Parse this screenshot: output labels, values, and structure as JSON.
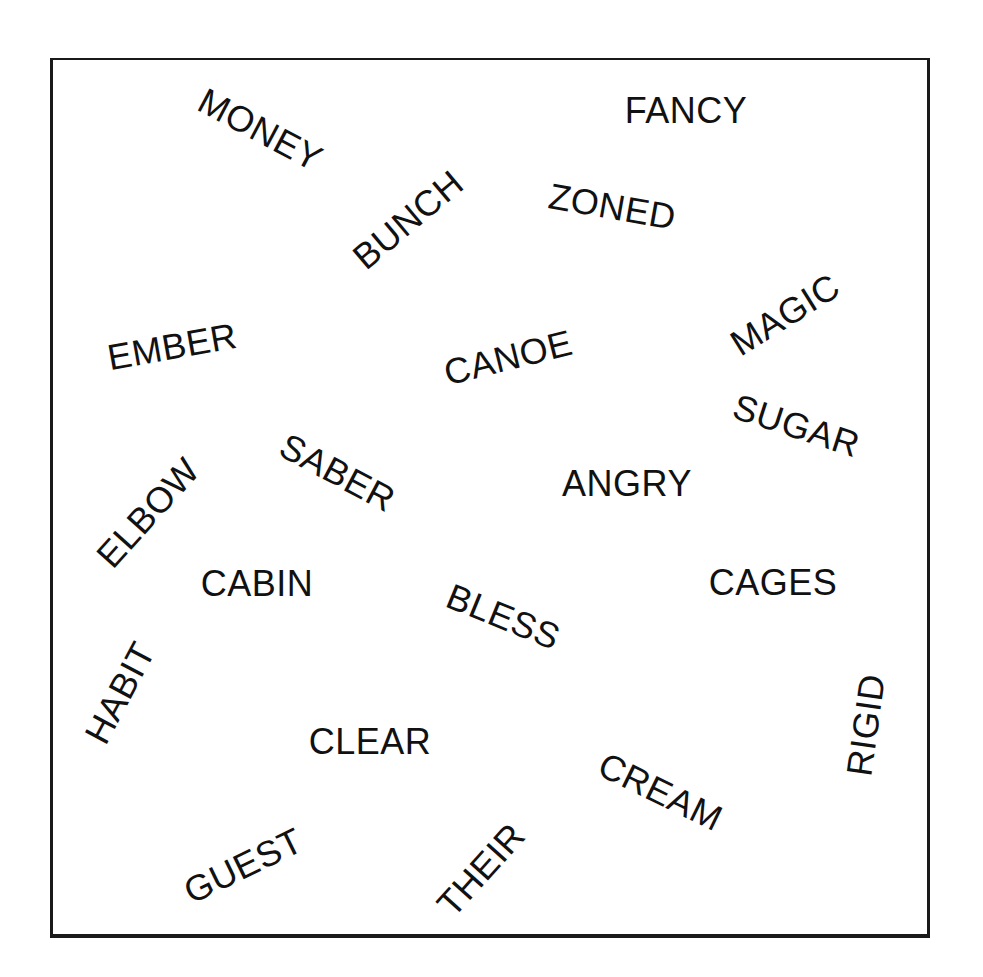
{
  "words": [
    {
      "text": "MONEY",
      "cx": 260,
      "cy": 130,
      "rotate": 28
    },
    {
      "text": "FANCY",
      "cx": 686,
      "cy": 111,
      "rotate": 0
    },
    {
      "text": "BUNCH",
      "cx": 408,
      "cy": 220,
      "rotate": -40
    },
    {
      "text": "ZONED",
      "cx": 612,
      "cy": 207,
      "rotate": 10
    },
    {
      "text": "EMBER",
      "cx": 172,
      "cy": 347,
      "rotate": -10
    },
    {
      "text": "CANOE",
      "cx": 508,
      "cy": 358,
      "rotate": -14
    },
    {
      "text": "MAGIC",
      "cx": 785,
      "cy": 315,
      "rotate": -32
    },
    {
      "text": "SUGAR",
      "cx": 796,
      "cy": 426,
      "rotate": 18
    },
    {
      "text": "SABER",
      "cx": 337,
      "cy": 473,
      "rotate": 28
    },
    {
      "text": "ANGRY",
      "cx": 627,
      "cy": 484,
      "rotate": 0
    },
    {
      "text": "ELBOW",
      "cx": 148,
      "cy": 513,
      "rotate": -48
    },
    {
      "text": "CABIN",
      "cx": 257,
      "cy": 584,
      "rotate": 0
    },
    {
      "text": "BLESS",
      "cx": 503,
      "cy": 617,
      "rotate": 22
    },
    {
      "text": "CAGES",
      "cx": 773,
      "cy": 583,
      "rotate": 0
    },
    {
      "text": "HABIT",
      "cx": 120,
      "cy": 693,
      "rotate": -62
    },
    {
      "text": "RIGID",
      "cx": 866,
      "cy": 725,
      "rotate": -82
    },
    {
      "text": "CLEAR",
      "cx": 370,
      "cy": 742,
      "rotate": 0
    },
    {
      "text": "CREAM",
      "cx": 660,
      "cy": 792,
      "rotate": 26
    },
    {
      "text": "GUEST",
      "cx": 243,
      "cy": 866,
      "rotate": -26
    },
    {
      "text": "THEIR",
      "cx": 481,
      "cy": 870,
      "rotate": -48
    }
  ]
}
